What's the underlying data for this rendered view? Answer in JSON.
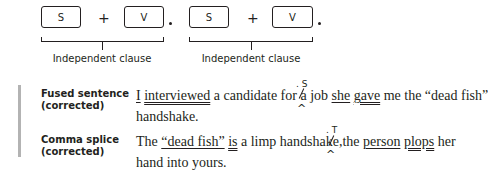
{
  "diagram": {
    "clauses": [
      {
        "subject": "S",
        "plus": "+",
        "verb": "V",
        "label": "Independent clause"
      },
      {
        "subject": "S",
        "plus": "+",
        "verb": "V",
        "label": "Independent clause"
      }
    ]
  },
  "examples": [
    {
      "label_line1": "Fused sentence",
      "label_line2": "(corrected)",
      "line1_parts": [
        "I",
        " ",
        "interviewed",
        " a candidate for a job ",
        "she",
        " ",
        "gave",
        " me the “dead fish”"
      ],
      "line2": "handshake.",
      "insert_mark": ". S",
      "caret": "^"
    },
    {
      "label_line1": "Comma splice",
      "label_line2": "(corrected)",
      "line1_parts": [
        "The ",
        "“dead fish”",
        " ",
        "is",
        " a limp handshake",
        ",",
        "the",
        " ",
        "person",
        " ",
        "plops",
        " her"
      ],
      "line2": "hand into yours.",
      "insert_mark": ". T",
      "caret": "^"
    }
  ],
  "colors": {
    "text": "#231f20",
    "sidebar_bar": "#b3b3b3"
  }
}
